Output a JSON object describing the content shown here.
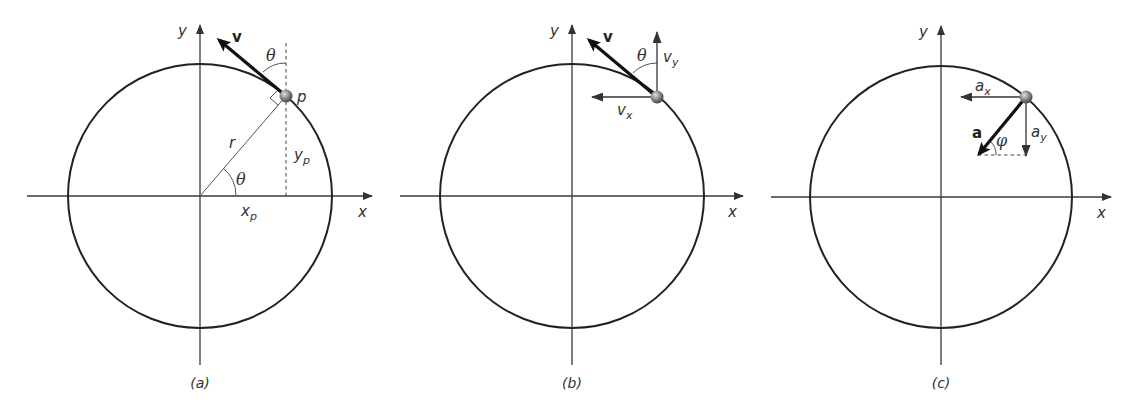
{
  "figure": {
    "panels": [
      {
        "id": "a",
        "caption": "(a)",
        "axis_labels": {
          "x": "x",
          "y": "y"
        },
        "labels": {
          "velocity": "v",
          "theta_top": "θ",
          "point": "p",
          "radius": "r",
          "y_coord_main": "y",
          "y_coord_sub": "p",
          "theta_center": "θ",
          "x_coord_main": "x",
          "x_coord_sub": "p"
        }
      },
      {
        "id": "b",
        "caption": "(b)",
        "axis_labels": {
          "x": "x",
          "y": "y"
        },
        "labels": {
          "velocity": "v",
          "theta": "θ",
          "vy_main": "v",
          "vy_sub": "y",
          "vx_main": "v",
          "vx_sub": "x"
        }
      },
      {
        "id": "c",
        "caption": "(c)",
        "axis_labels": {
          "x": "x",
          "y": "y"
        },
        "labels": {
          "ax_main": "a",
          "ax_sub": "x",
          "accel": "a",
          "phi": "φ",
          "ay_main": "a",
          "ay_sub": "y"
        }
      }
    ]
  }
}
